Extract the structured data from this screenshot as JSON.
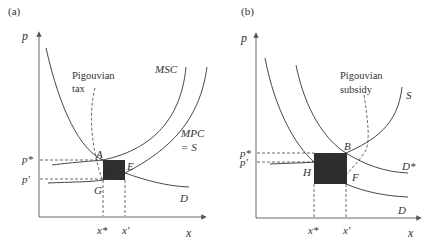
{
  "figure": {
    "panels": [
      {
        "id": "a",
        "panel_label": "(a)",
        "y_axis_label": "p",
        "x_axis_label": "x",
        "price_ticks": [
          "p*",
          "p'"
        ],
        "quantity_ticks": [
          "x*",
          "x'"
        ],
        "curves": {
          "msc": "MSC",
          "mpc_line1": "MPC",
          "mpc_line2": "= S",
          "demand": "D"
        },
        "points": {
          "a": "A",
          "e": "E",
          "g": "G"
        },
        "annotation_line1": "Pigouvian",
        "annotation_line2": "tax"
      },
      {
        "id": "b",
        "panel_label": "(b)",
        "y_axis_label": "p",
        "x_axis_label": "x",
        "price_ticks": [
          "p*",
          "p'"
        ],
        "quantity_ticks": [
          "x*",
          "x'"
        ],
        "curves": {
          "supply": "S",
          "demand_star": "D*",
          "demand": "D"
        },
        "points": {
          "b": "B",
          "f": "F",
          "h": "H"
        },
        "annotation_line1": "Pigouvian",
        "annotation_line2": "subsidy"
      }
    ],
    "colors": {
      "line": "#333333",
      "shaded_region": "#2e2e2e",
      "background": "#ffffff"
    }
  }
}
